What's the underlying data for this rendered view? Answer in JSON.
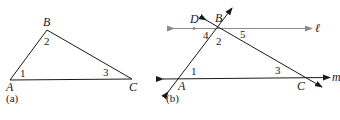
{
  "figure_a": {
    "caption": "(a)",
    "vertices": {
      "A": "A",
      "B": "B",
      "C": "C"
    },
    "angles": {
      "angle1": "1",
      "angle2": "2",
      "angle3": "3"
    }
  },
  "figure_b": {
    "caption": "(b)",
    "points": {
      "A": "A",
      "B": "B",
      "C": "C",
      "D": "D"
    },
    "lines": {
      "l": "ℓ",
      "m": "m"
    },
    "angles": {
      "angle1": "1",
      "angle2": "2",
      "angle3": "3",
      "angle4": "4",
      "angle5": "5"
    }
  },
  "colors": {
    "line": "#1a1a1a",
    "parallel_line": "#8a8a8a"
  }
}
